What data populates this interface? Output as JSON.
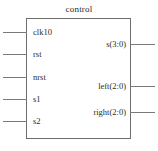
{
  "diagram": {
    "type": "block-diagram",
    "title": "control",
    "block": {
      "name": "control",
      "x": 26,
      "y": 18,
      "width": 105,
      "height": 121,
      "border_color": "#6e6e6e",
      "fill_color": "#ffffff"
    },
    "wire_color": "#7a7a7a",
    "text_color": "#2b2b2b",
    "inputs": [
      {
        "label": "clk10",
        "y": 32
      },
      {
        "label": "rst",
        "y": 54
      },
      {
        "label": "nrst",
        "y": 77
      },
      {
        "label": "s1",
        "y": 99
      },
      {
        "label": "s2",
        "y": 121
      }
    ],
    "outputs": [
      {
        "label": "s(3:0)",
        "y": 44
      },
      {
        "label": "left(2:0)",
        "y": 86
      },
      {
        "label": "right(2:0)",
        "y": 112
      }
    ]
  }
}
